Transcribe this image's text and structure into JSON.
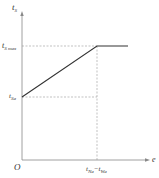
{
  "diagram": {
    "y_axis_label": "t",
    "y_axis_label_sub": "S",
    "x_axis_label": "e",
    "origin_label": "O",
    "y_ticks": [
      {
        "main": "t",
        "sub": "S max"
      },
      {
        "main": "t",
        "sub": "Sa"
      }
    ],
    "x_tick": {
      "main1": "t",
      "sub1": "Na",
      "sep": "−",
      "main2": "t",
      "sub2": "Wa"
    },
    "curve": {
      "description": "piecewise linear: rises from t_Sa at e=0 to t_S max at e = t_Na − t_Wa, then constant",
      "points": [
        [
          "0",
          "t_Sa"
        ],
        [
          "t_Na − t_Wa",
          "t_S max"
        ],
        [
          "beyond",
          "t_S max"
        ]
      ]
    },
    "colors": {
      "line": "#333333",
      "axis": "#888888",
      "dashed": "#999999"
    }
  }
}
